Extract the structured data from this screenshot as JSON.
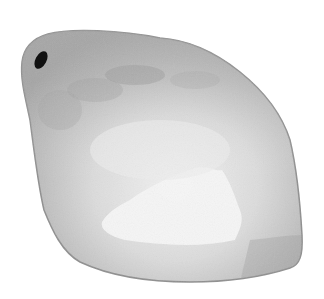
{
  "image": {
    "subject": "grayscale watercolor-style rounded irregular object with small dark oval spot",
    "background_color": "#ffffff",
    "colors": {
      "body_dark": "#9a9a9a",
      "body_mid": "#b4b4b4",
      "body_light": "#d6d6d6",
      "highlight": "#f4f4f4",
      "spot": "#111111",
      "edge": "#8c8c8c"
    }
  }
}
